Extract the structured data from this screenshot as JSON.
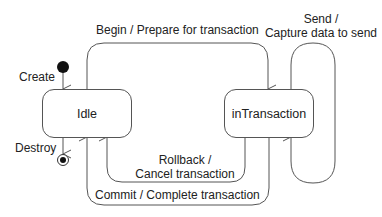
{
  "diagram": {
    "type": "state-machine",
    "states": [
      {
        "id": "idle",
        "label": "Idle"
      },
      {
        "id": "inTransaction",
        "label": "inTransaction"
      }
    ],
    "pseudostates": {
      "initial": {
        "label": "Create"
      },
      "final": {
        "label": "Destroy"
      }
    },
    "transitions": {
      "begin": {
        "from": "Idle",
        "to": "inTransaction",
        "label": "Begin / Prepare for transaction"
      },
      "send": {
        "from": "inTransaction",
        "to": "inTransaction",
        "label_line1": "Send /",
        "label_line2": "Capture data to send"
      },
      "rollback": {
        "from": "inTransaction",
        "to": "Idle",
        "label_line1": "Rollback /",
        "label_line2": "Cancel transaction"
      },
      "commit": {
        "from": "inTransaction",
        "to": "Idle",
        "label": "Commit / Complete transaction"
      }
    },
    "colors": {
      "line": "#555555",
      "text": "#222222",
      "node": "#111111"
    }
  }
}
